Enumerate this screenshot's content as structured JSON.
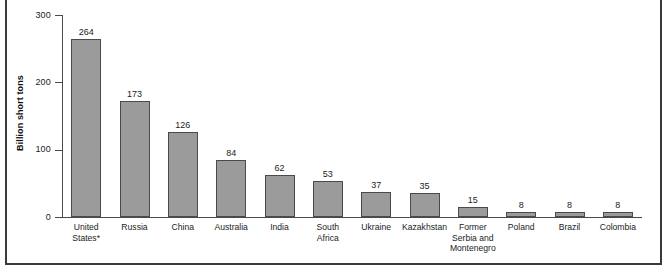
{
  "chart_data": {
    "type": "bar",
    "title": "",
    "subtitle": "",
    "xlabel": "",
    "ylabel": "Billion short tons",
    "ylim": [
      0,
      300
    ],
    "yticks": [
      "0",
      "100",
      "200",
      "300"
    ],
    "grid": false,
    "legend": null,
    "orientation": "vertical",
    "categories": [
      "United States*",
      "Russia",
      "China",
      "Australia",
      "India",
      "South Africa",
      "Ukraine",
      "Kazakhstan",
      "Former Serbia and Montenegro",
      "Poland",
      "Brazil",
      "Colombia"
    ],
    "values": [
      264,
      173,
      126,
      84,
      62,
      53,
      37,
      35,
      15,
      8,
      8,
      8
    ],
    "value_labels": [
      "264",
      "173",
      "126",
      "84",
      "62",
      "53",
      "37",
      "35",
      "15",
      "8",
      "8",
      "8"
    ],
    "category_label_lines": [
      [
        "United",
        "States*"
      ],
      [
        "Russia"
      ],
      [
        "China"
      ],
      [
        "Australia"
      ],
      [
        "India"
      ],
      [
        "South",
        "Africa"
      ],
      [
        "Ukraine"
      ],
      [
        "Kazakhstan"
      ],
      [
        "Former",
        "Serbia and",
        "Montenegro"
      ],
      [
        "Poland"
      ],
      [
        "Brazil"
      ],
      [
        "Colombia"
      ]
    ],
    "colors": {
      "bar_fill": "#9b9b9b",
      "bar_stroke": "#4a4a4a",
      "axis": "#4a4a4a",
      "text": "#1c1c1c",
      "frame": "#3a3a3a",
      "background": "#ffffff"
    }
  }
}
